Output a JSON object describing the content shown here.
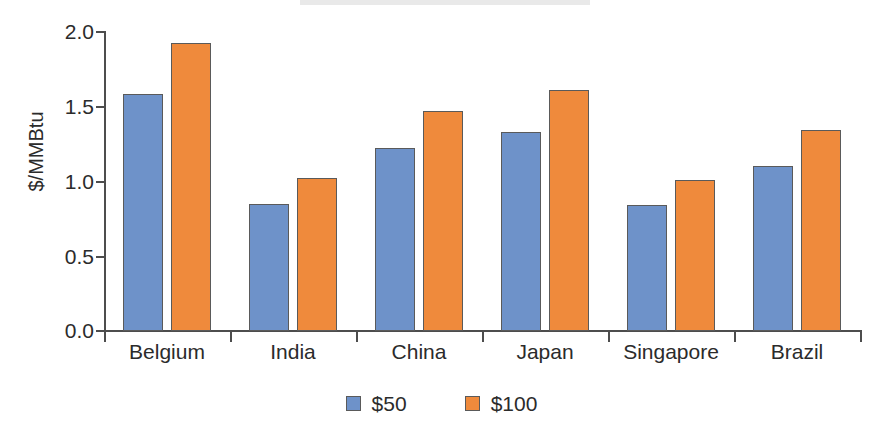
{
  "chart_data": {
    "type": "bar",
    "title": "",
    "xlabel": "",
    "ylabel": "$/MMBtu",
    "categories": [
      "Belgium",
      "India",
      "China",
      "Japan",
      "Singapore",
      "Brazil"
    ],
    "series": [
      {
        "name": "$50",
        "color": "#6e92c9",
        "values": [
          1.58,
          0.85,
          1.22,
          1.33,
          0.84,
          1.1
        ]
      },
      {
        "name": "$100",
        "color": "#ef8a3c",
        "values": [
          1.92,
          1.02,
          1.47,
          1.61,
          1.01,
          1.34
        ]
      }
    ],
    "ylim": [
      0.0,
      2.0
    ],
    "ytick_labels": [
      "0.0",
      "0.5",
      "1.0",
      "1.5",
      "2.0"
    ],
    "ytick_values": [
      0.0,
      0.5,
      1.0,
      1.5,
      2.0
    ],
    "grid": false,
    "legend_position": "bottom-center"
  },
  "axis": {
    "y_label": "$/MMBtu",
    "ticks": {
      "t20": "2.0",
      "t15": "1.5",
      "t10": "1.0",
      "t05": "0.5",
      "t00": "0.0"
    }
  },
  "categories": {
    "c0": "Belgium",
    "c1": "India",
    "c2": "China",
    "c3": "Japan",
    "c4": "Singapore",
    "c5": "Brazil"
  },
  "legend": {
    "items": [
      {
        "label": "$50",
        "color": "#6e92c9"
      },
      {
        "label": "$100",
        "color": "#ef8a3c"
      }
    ],
    "label_0": "$50",
    "label_1": "$100"
  }
}
